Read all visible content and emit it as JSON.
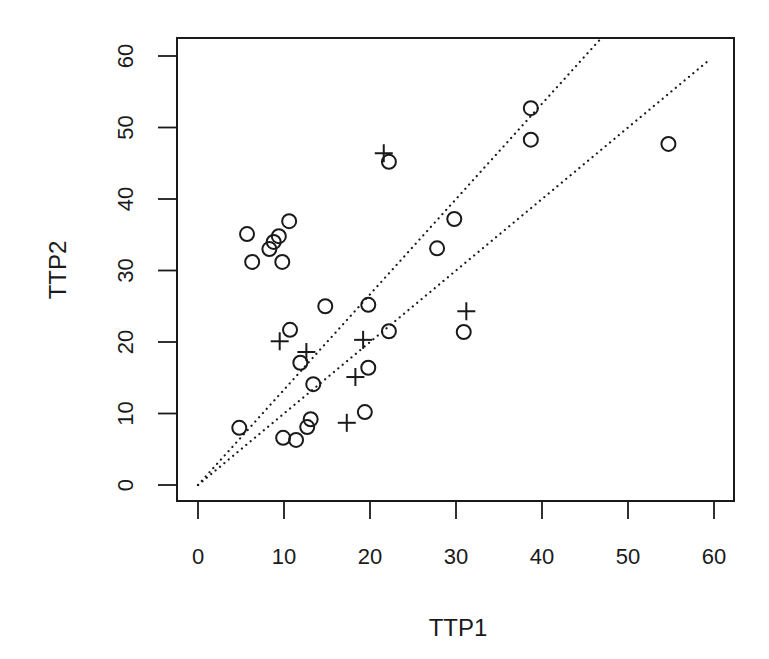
{
  "chart_data": {
    "type": "scatter",
    "title": "",
    "xlabel": "TTP1",
    "ylabel": "TTP2",
    "xlim": [
      0,
      60
    ],
    "ylim": [
      0,
      60
    ],
    "xticks": [
      0,
      10,
      20,
      30,
      40,
      50,
      60
    ],
    "yticks": [
      0,
      10,
      20,
      30,
      40,
      50,
      60
    ],
    "grid": false,
    "legend": null,
    "series": [
      {
        "name": "circle",
        "marker": "circle-open",
        "points": [
          [
            5.7,
            35.1
          ],
          [
            10.6,
            36.9
          ],
          [
            8.3,
            33.0
          ],
          [
            8.8,
            34.0
          ],
          [
            9.4,
            34.8
          ],
          [
            6.3,
            31.2
          ],
          [
            9.8,
            31.2
          ],
          [
            14.8,
            25.0
          ],
          [
            19.8,
            25.2
          ],
          [
            10.7,
            21.7
          ],
          [
            22.2,
            21.5
          ],
          [
            11.9,
            17.1
          ],
          [
            19.8,
            16.4
          ],
          [
            13.4,
            14.1
          ],
          [
            4.8,
            8.0
          ],
          [
            9.9,
            6.6
          ],
          [
            11.4,
            6.3
          ],
          [
            12.7,
            8.1
          ],
          [
            13.1,
            9.2
          ],
          [
            19.4,
            10.2
          ],
          [
            22.2,
            45.2
          ],
          [
            29.8,
            37.2
          ],
          [
            27.8,
            33.1
          ],
          [
            30.9,
            21.4
          ],
          [
            38.7,
            52.7
          ],
          [
            38.7,
            48.3
          ],
          [
            54.7,
            47.7
          ]
        ]
      },
      {
        "name": "plus",
        "marker": "plus",
        "points": [
          [
            21.6,
            46.4
          ],
          [
            9.5,
            20.1
          ],
          [
            12.6,
            18.6
          ],
          [
            19.2,
            20.3
          ],
          [
            18.3,
            15.1
          ],
          [
            17.3,
            8.7
          ],
          [
            31.2,
            24.3
          ]
        ]
      }
    ],
    "reference_lines": [
      {
        "name": "identity",
        "style": "dotted",
        "slope": 1.0,
        "intercept": 0,
        "x_range": [
          0,
          59.5
        ]
      },
      {
        "name": "steep",
        "style": "dotted",
        "slope": 1.333,
        "intercept": 0,
        "x_range": [
          0,
          47.1
        ]
      }
    ]
  },
  "layout": {
    "plot_box": {
      "left": 177,
      "top": 38,
      "right": 734,
      "bottom": 501
    },
    "x_px_per_unit": 8.6,
    "x_zero_px": 198,
    "y_px_per_unit": 7.15,
    "y_zero_px": 485,
    "colors": {
      "ink": "#1a1a1a",
      "background": "#ffffff"
    }
  }
}
